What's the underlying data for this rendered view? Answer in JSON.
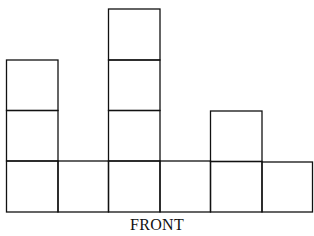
{
  "diagram": {
    "label": "FRONT",
    "columns": [
      3,
      1,
      4,
      1,
      2,
      1
    ],
    "stroke_color": "#111111",
    "background": "#ffffff"
  }
}
